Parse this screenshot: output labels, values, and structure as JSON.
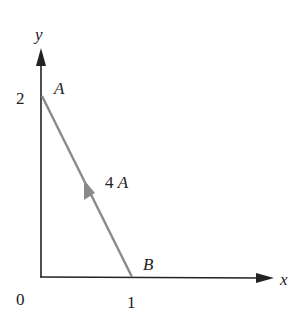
{
  "axes": {
    "x_label": "x",
    "y_label": "y",
    "origin_label": "0",
    "x_tick": "1",
    "y_tick": "2",
    "axis_color": "#222222"
  },
  "wire": {
    "start_label": "A",
    "end_label": "B",
    "current_label": "4 A",
    "color": "#8a8a8a",
    "from": [
      1,
      0
    ],
    "to": [
      0,
      2
    ],
    "direction": "B to A"
  }
}
